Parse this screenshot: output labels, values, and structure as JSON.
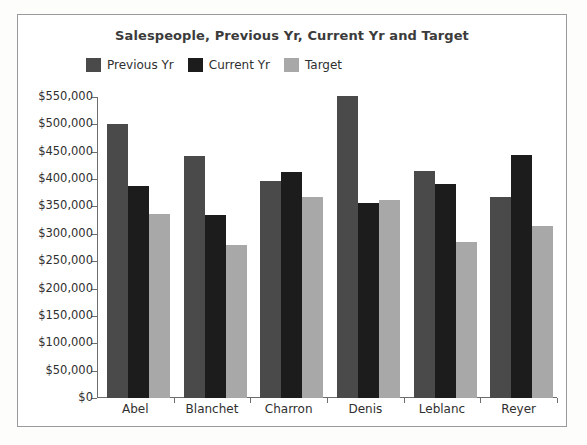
{
  "chart_data": {
    "type": "bar",
    "title": "Salespeople, Previous Yr, Current Yr and Target",
    "xlabel": "",
    "ylabel": "",
    "categories": [
      "Abel",
      "Blanchet",
      "Charron",
      "Denis",
      "Leblanc",
      "Reyer"
    ],
    "series": [
      {
        "name": "Previous Yr",
        "color": "#4a4a4a",
        "values": [
          500000,
          442000,
          397000,
          551000,
          415000,
          368000
        ]
      },
      {
        "name": "Current Yr",
        "color": "#1c1c1c",
        "values": [
          387000,
          334000,
          413000,
          356000,
          391000,
          444000
        ]
      },
      {
        "name": "Target",
        "color": "#a8a8a8",
        "values": [
          336000,
          279000,
          367000,
          362000,
          285000,
          315000
        ]
      }
    ],
    "ylim": [
      0,
      550000
    ],
    "y_ticks": [
      0,
      50000,
      100000,
      150000,
      200000,
      250000,
      300000,
      350000,
      400000,
      450000,
      500000,
      550000
    ],
    "y_tick_labels": [
      "$0",
      "$50,000",
      "$100,000",
      "$150,000",
      "$200,000",
      "$250,000",
      "$300,000",
      "$350,000",
      "$400,000",
      "$450,000",
      "$500,000",
      "$550,000"
    ],
    "grid": false,
    "legend_position": "top-left"
  },
  "frame": {
    "border_color": "#9a9a9a",
    "background": "#ffffff"
  }
}
